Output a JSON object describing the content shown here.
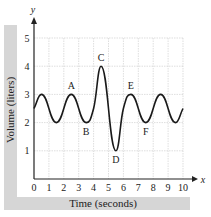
{
  "chart_data": {
    "type": "line",
    "title": "",
    "xlabel": "Time (seconds)",
    "ylabel": "Volume (liters)",
    "x_axis_symbol": "x",
    "y_axis_symbol": "y",
    "xlim": [
      0,
      10
    ],
    "ylim": [
      0,
      5
    ],
    "x_ticks": [
      0,
      1,
      2,
      3,
      4,
      5,
      6,
      7,
      8,
      9,
      10
    ],
    "y_ticks": [
      1,
      2,
      3,
      4,
      5
    ],
    "grid": true,
    "legend": null,
    "series": [
      {
        "name": "Volume",
        "x": [
          0,
          0.5,
          1.5,
          2.5,
          3.5,
          4.0,
          4.5,
          5.5,
          6.0,
          6.5,
          7.5,
          8.5,
          9.5,
          10
        ],
        "y": [
          2.5,
          3,
          2,
          3,
          2,
          2.5,
          4,
          1,
          2.5,
          3,
          2,
          3,
          2,
          2.5
        ]
      }
    ],
    "annotations": [
      {
        "label": "A",
        "x": 2.5,
        "y": 3
      },
      {
        "label": "B",
        "x": 3.5,
        "y": 2
      },
      {
        "label": "C",
        "x": 4.5,
        "y": 4
      },
      {
        "label": "D",
        "x": 5.5,
        "y": 1
      },
      {
        "label": "E",
        "x": 6.5,
        "y": 3
      },
      {
        "label": "F",
        "x": 7.5,
        "y": 2
      }
    ]
  },
  "colors": {
    "line": "#1a1a1a",
    "grid": "#c8c8c8",
    "band": "#d6d6d6"
  }
}
